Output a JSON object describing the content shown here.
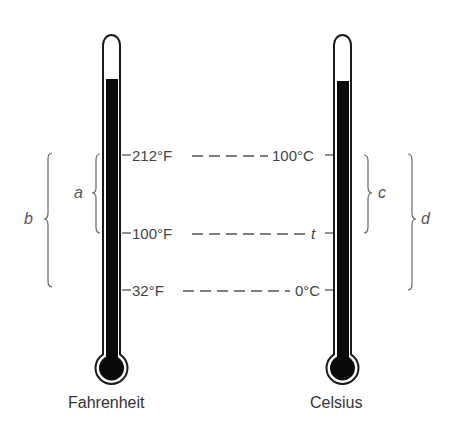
{
  "diagram": {
    "thermometers": [
      {
        "name": "Fahrenheit",
        "caption": "Fahrenheit",
        "marks": [
          {
            "label": "212°F",
            "value": 212
          },
          {
            "label": "100°F",
            "value": 100
          },
          {
            "label": "32°F",
            "value": 32
          }
        ]
      },
      {
        "name": "Celsius",
        "caption": "Celsius",
        "marks": [
          {
            "label": "100°C",
            "value": 100
          },
          {
            "label": "t",
            "value": "t"
          },
          {
            "label": "0°C",
            "value": 0
          }
        ]
      }
    ],
    "braces": [
      {
        "label": "a",
        "spans": "212°F to 100°F"
      },
      {
        "label": "b",
        "spans": "212°F to 32°F"
      },
      {
        "label": "c",
        "spans": "100°C to t"
      },
      {
        "label": "d",
        "spans": "100°C to 0°C"
      }
    ],
    "colors": {
      "mercury": "#0a0a0a",
      "outline": "#1a1a1a",
      "text": "#444444",
      "dash": "#555555"
    }
  }
}
